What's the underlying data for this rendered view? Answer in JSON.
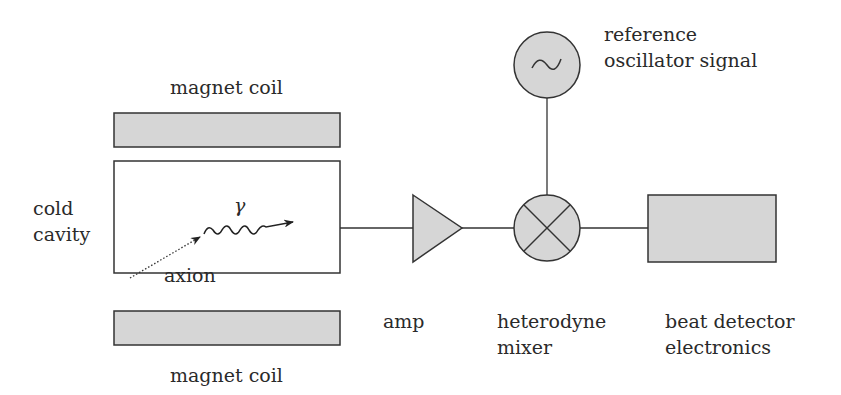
{
  "diagram": {
    "labels": {
      "magnet_coil_top": "magnet coil",
      "magnet_coil_bottom": "magnet coil",
      "cold": "cold",
      "cavity": "cavity",
      "gamma": "γ",
      "axion": "axion",
      "amp": "amp",
      "heterodyne": "heterodyne",
      "mixer": "mixer",
      "beat_detector": "beat detector",
      "electronics": "electronics",
      "reference": "reference",
      "oscillator_signal": "oscillator signal"
    },
    "colors": {
      "fill": "#d6d6d6",
      "stroke": "#333333",
      "text": "#2a2a2a"
    }
  }
}
